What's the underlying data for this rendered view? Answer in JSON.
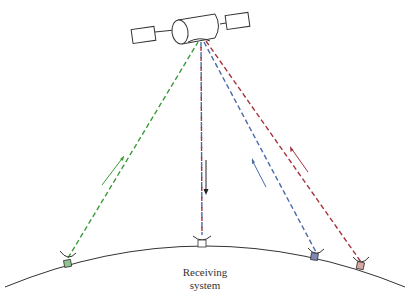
{
  "diagram": {
    "receiver_label_line1": "Receiving",
    "receiver_label_line2": "system",
    "colors": {
      "green": "#3a9a3a",
      "red": "#a8323c",
      "blue": "#4a6aa8",
      "line": "#333333",
      "green_station": "#8fc48f",
      "blue_station": "#7f88b8",
      "pink_station": "#d9a8a0"
    },
    "satellite": {
      "x": 200,
      "y": 40
    },
    "stations": [
      {
        "name": "green-station",
        "x": 68,
        "y": 262
      },
      {
        "name": "receiving-system",
        "x": 203,
        "y": 240
      },
      {
        "name": "blue-station",
        "x": 316,
        "y": 257
      },
      {
        "name": "pink-station",
        "x": 361,
        "y": 266
      }
    ]
  }
}
